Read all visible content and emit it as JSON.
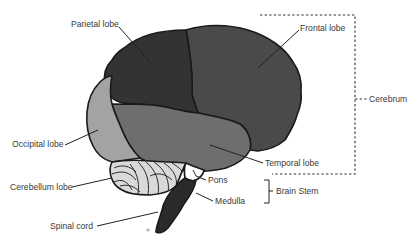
{
  "diagram": {
    "labels": {
      "parietal": "Parietal lobe",
      "frontal": "Frontal lobe",
      "cerebrum": "Cerebrum",
      "occipital": "Occipital lobe",
      "temporal": "Temporal lobe",
      "cerebellum": "Cerebellum lobe",
      "pons": "Pons",
      "brain_stem": "Brain Stem",
      "medulla": "Medulla",
      "spinal_cord": "Spinal cord"
    },
    "colors": {
      "frontal": "#4a4a4a",
      "parietal": "#333333",
      "temporal": "#6e6e6e",
      "occipital": "#a3a3a3",
      "cerebellum": "#d9d9d9",
      "stem": "#2a2a2a",
      "pons": "#ffffff",
      "text": "#3a3a3a"
    }
  }
}
